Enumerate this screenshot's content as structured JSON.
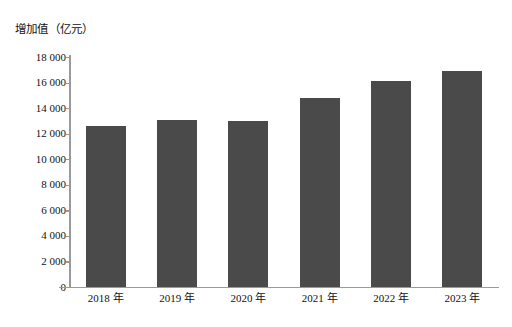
{
  "chart_data": {
    "type": "bar",
    "title": "增加值（亿元）",
    "xlabel": "",
    "ylabel": "增加值（亿元）",
    "categories": [
      "2018 年",
      "2019 年",
      "2020 年",
      "2021 年",
      "2022 年",
      "2023 年"
    ],
    "values": [
      12600,
      13100,
      13000,
      14800,
      16100,
      16900
    ],
    "ylim": [
      0,
      18000
    ],
    "ytick_step": 2000,
    "ytick_labels": [
      "18 000",
      "16 000",
      "14 000",
      "12 000",
      "10 000",
      "8 000",
      "6 000",
      "4 000",
      "2 000",
      "0"
    ],
    "ytick_values": [
      18000,
      16000,
      14000,
      12000,
      10000,
      8000,
      6000,
      4000,
      2000,
      0
    ],
    "grid": false,
    "legend": null,
    "series": [
      {
        "name": "增加值",
        "values": [
          12600,
          13100,
          13000,
          14800,
          16100,
          16900
        ]
      }
    ],
    "colors": {
      "bar": "#4a4a4a",
      "axis": "#9a9a9a",
      "text": "#111111",
      "background": "#ffffff"
    }
  }
}
